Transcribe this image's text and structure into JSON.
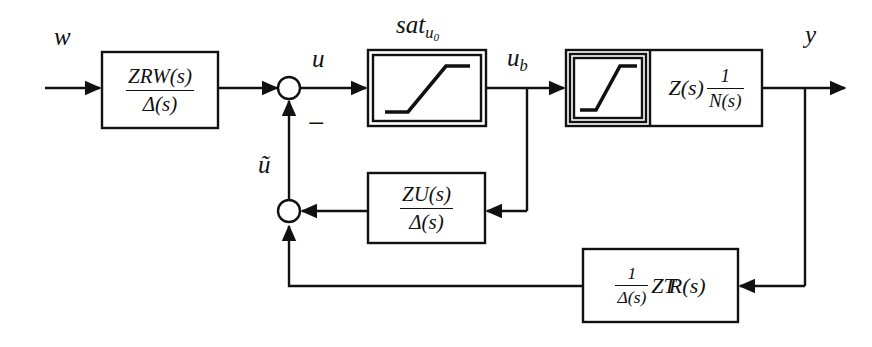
{
  "figure": {
    "type": "control-system-block-diagram",
    "width": 872,
    "height": 347,
    "background_color": "#ffffff",
    "line_color": "#111111",
    "signals": {
      "input": "w",
      "control": "u",
      "saturated_control": "u_b",
      "feedback_correction": "u-tilde",
      "output": "y"
    },
    "labels": {
      "input_w": "w",
      "control_u": "u",
      "saturated_ub_base": "u",
      "saturated_ub_sub": "b",
      "tilde_u": "ũ",
      "output_y": "y",
      "sat_name": "sat",
      "sat_sub_u": "u",
      "sat_sub_zero": "0",
      "minus": "−"
    },
    "blocks": [
      {
        "id": "block-zrw",
        "name": "rw-transfer-block",
        "numerator_base": "Z",
        "numerator_sub": "RW",
        "numerator_arg": "(s)",
        "denominator": "Δ(s)",
        "x": 102,
        "y": 52,
        "w": 116,
        "h": 76
      },
      {
        "id": "block-sat-u0",
        "name": "saturation-block",
        "label": "sat",
        "label_sub": "u0",
        "double_border": true,
        "x": 368,
        "y": 50,
        "w": 118,
        "h": 76
      },
      {
        "id": "block-plant",
        "name": "plant-block",
        "inner_saturation": true,
        "expr_left": "Z(s)",
        "expr_frac_num": "1",
        "expr_frac_den": "N(s)",
        "x": 566,
        "y": 50,
        "w": 196,
        "h": 76
      },
      {
        "id": "block-zu",
        "name": "zu-feedback-block",
        "numerator_base": "Z",
        "numerator_sub": "U",
        "numerator_arg": "(s)",
        "denominator": "Δ(s)",
        "x": 368,
        "y": 173,
        "w": 117,
        "h": 70
      },
      {
        "id": "block-zr",
        "name": "zr-transpose-feedback-block",
        "frac_num": "1",
        "frac_den": "Δ(s)",
        "expr_base": "Z",
        "expr_sub": "R",
        "expr_sup": "T",
        "expr_arg": "(s)",
        "x": 583,
        "y": 249,
        "w": 155,
        "h": 73
      }
    ],
    "junctions": [
      {
        "id": "sum-1",
        "name": "summing-junction-upper",
        "x": 289,
        "y": 88,
        "r": 11,
        "style": "open-circle",
        "sign": "−"
      },
      {
        "id": "sum-2",
        "name": "summing-junction-lower",
        "x": 289,
        "y": 211,
        "r": 11,
        "style": "open-circle"
      },
      {
        "id": "node-ub",
        "name": "signal-node-ub",
        "x": 527,
        "y": 88,
        "r": 5,
        "style": "filled-dot"
      },
      {
        "id": "node-y",
        "name": "signal-node-y",
        "x": 805,
        "y": 88,
        "r": 5,
        "style": "filled-dot"
      }
    ]
  }
}
